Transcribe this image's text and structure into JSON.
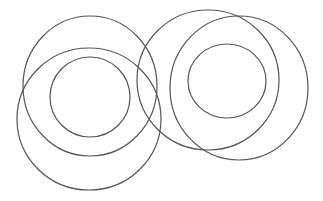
{
  "canvas": {
    "width": 323,
    "height": 201,
    "background": "#ffffff"
  },
  "stroke": {
    "color": "#555555",
    "width": 1.2
  },
  "groups": [
    {
      "name": "left-group",
      "circles": [
        {
          "name": "left-upper-circle",
          "cx": 90,
          "cy": 86,
          "rx": 67,
          "ry": 70
        },
        {
          "name": "left-lower-circle",
          "cx": 89,
          "cy": 119,
          "rx": 72,
          "ry": 71
        },
        {
          "name": "left-inner-circle",
          "cx": 90,
          "cy": 97,
          "rx": 40,
          "ry": 40
        }
      ]
    },
    {
      "name": "right-group",
      "circles": [
        {
          "name": "right-left-circle",
          "cx": 208,
          "cy": 80,
          "rx": 71,
          "ry": 70
        },
        {
          "name": "right-right-circle",
          "cx": 239,
          "cy": 88,
          "rx": 69,
          "ry": 72
        },
        {
          "name": "right-inner-circle",
          "cx": 227,
          "cy": 81,
          "rx": 39,
          "ry": 37
        }
      ]
    }
  ]
}
